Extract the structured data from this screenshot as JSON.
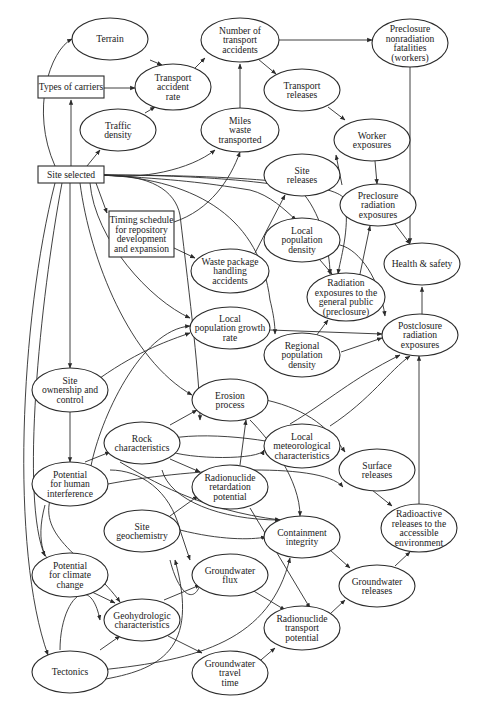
{
  "diagram": {
    "type": "influence-diagram",
    "nodes": [
      {
        "id": "terrain",
        "shape": "ellipse",
        "cx": 110,
        "cy": 39,
        "rx": 38,
        "ry": 21,
        "lines": [
          "Terrain"
        ]
      },
      {
        "id": "num_transport_accidents",
        "shape": "ellipse",
        "cx": 240,
        "cy": 40,
        "rx": 39,
        "ry": 22,
        "lines": [
          "Number of",
          "transport",
          "accidents"
        ]
      },
      {
        "id": "preclosure_nonradiation",
        "shape": "ellipse",
        "cx": 410,
        "cy": 43,
        "rx": 38,
        "ry": 24,
        "lines": [
          "Preclosure",
          "nonradiation",
          "fatalities",
          "(workers)"
        ]
      },
      {
        "id": "types_of_carriers",
        "shape": "rect",
        "x": 38,
        "y": 76,
        "w": 66,
        "h": 22,
        "lines": [
          "Types of carriers"
        ]
      },
      {
        "id": "transport_accident_rate",
        "shape": "ellipse",
        "cx": 173,
        "cy": 87,
        "rx": 38,
        "ry": 23,
        "lines": [
          "Transport",
          "accident",
          "rate"
        ]
      },
      {
        "id": "transport_releases",
        "shape": "ellipse",
        "cx": 302,
        "cy": 90,
        "rx": 38,
        "ry": 21,
        "lines": [
          "Transport",
          "releases"
        ]
      },
      {
        "id": "traffic_density",
        "shape": "ellipse",
        "cx": 118,
        "cy": 130,
        "rx": 38,
        "ry": 21,
        "lines": [
          "Traffic",
          "density"
        ]
      },
      {
        "id": "miles_waste_transported",
        "shape": "ellipse",
        "cx": 240,
        "cy": 130,
        "rx": 39,
        "ry": 22,
        "lines": [
          "Miles",
          "waste",
          "transported"
        ]
      },
      {
        "id": "worker_exposures",
        "shape": "ellipse",
        "cx": 372,
        "cy": 140,
        "rx": 38,
        "ry": 21,
        "lines": [
          "Worker",
          "exposures"
        ]
      },
      {
        "id": "site_selected",
        "shape": "rect",
        "x": 38,
        "y": 166,
        "w": 66,
        "h": 17,
        "lines": [
          "Site selected"
        ]
      },
      {
        "id": "site_releases",
        "shape": "ellipse",
        "cx": 302,
        "cy": 175,
        "rx": 38,
        "ry": 21,
        "lines": [
          "Site",
          "releases"
        ]
      },
      {
        "id": "preclosure_radiation",
        "shape": "ellipse",
        "cx": 378,
        "cy": 205,
        "rx": 38,
        "ry": 21,
        "lines": [
          "Preclosure",
          "radiation",
          "exposures"
        ]
      },
      {
        "id": "timing_schedule",
        "shape": "rect",
        "x": 109,
        "y": 211,
        "w": 65,
        "h": 46,
        "lines": [
          "Timing schedule",
          "for repository",
          "development",
          "and expansion"
        ]
      },
      {
        "id": "local_population_density",
        "shape": "ellipse",
        "cx": 302,
        "cy": 240,
        "rx": 38,
        "ry": 22,
        "lines": [
          "Local",
          "population",
          "density"
        ]
      },
      {
        "id": "waste_package_handling",
        "shape": "ellipse",
        "cx": 230,
        "cy": 271,
        "rx": 39,
        "ry": 22,
        "lines": [
          "Waste package",
          "handling",
          "accidents"
        ]
      },
      {
        "id": "health_safety",
        "shape": "ellipse",
        "cx": 422,
        "cy": 264,
        "rx": 38,
        "ry": 21,
        "lines": [
          "Health & safety"
        ]
      },
      {
        "id": "radiation_general_public",
        "shape": "ellipse",
        "cx": 346,
        "cy": 297,
        "rx": 39,
        "ry": 24,
        "lines": [
          "Radiation",
          "exposures to the",
          "general public",
          "(preclosure)"
        ]
      },
      {
        "id": "local_population_growth",
        "shape": "ellipse",
        "cx": 230,
        "cy": 328,
        "rx": 40,
        "ry": 21,
        "lines": [
          "Local",
          "population growth",
          "rate"
        ]
      },
      {
        "id": "postclosure_radiation",
        "shape": "ellipse",
        "cx": 420,
        "cy": 335,
        "rx": 38,
        "ry": 21,
        "lines": [
          "Postclosure",
          "radiation",
          "exposures"
        ]
      },
      {
        "id": "regional_population_density",
        "shape": "ellipse",
        "cx": 302,
        "cy": 355,
        "rx": 38,
        "ry": 22,
        "lines": [
          "Regional",
          "population",
          "density"
        ]
      },
      {
        "id": "site_ownership",
        "shape": "ellipse",
        "cx": 70,
        "cy": 390,
        "rx": 38,
        "ry": 22,
        "lines": [
          "Site",
          "ownership and",
          "control"
        ]
      },
      {
        "id": "erosion_process",
        "shape": "ellipse",
        "cx": 230,
        "cy": 400,
        "rx": 38,
        "ry": 21,
        "lines": [
          "Erosion",
          "process"
        ]
      },
      {
        "id": "rock_characteristics",
        "shape": "ellipse",
        "cx": 142,
        "cy": 443,
        "rx": 38,
        "ry": 21,
        "lines": [
          "Rock",
          "characteristics"
        ]
      },
      {
        "id": "local_meteorological",
        "shape": "ellipse",
        "cx": 302,
        "cy": 446,
        "rx": 38,
        "ry": 22,
        "lines": [
          "Local",
          "meteorological",
          "characteristics"
        ]
      },
      {
        "id": "surface_releases",
        "shape": "ellipse",
        "cx": 377,
        "cy": 470,
        "rx": 38,
        "ry": 21,
        "lines": [
          "Surface",
          "releases"
        ]
      },
      {
        "id": "potential_human_interference",
        "shape": "ellipse",
        "cx": 70,
        "cy": 484,
        "rx": 38,
        "ry": 22,
        "lines": [
          "Potential",
          "for human",
          "interference"
        ]
      },
      {
        "id": "radionuclide_retardation",
        "shape": "ellipse",
        "cx": 230,
        "cy": 487,
        "rx": 38,
        "ry": 22,
        "lines": [
          "Radionuclide",
          "retardation",
          "potential"
        ]
      },
      {
        "id": "radioactive_releases",
        "shape": "ellipse",
        "cx": 419,
        "cy": 528,
        "rx": 38,
        "ry": 24,
        "lines": [
          "Radioactive",
          "releases to the",
          "accessible",
          "environment"
        ]
      },
      {
        "id": "site_geochemistry",
        "shape": "ellipse",
        "cx": 142,
        "cy": 531,
        "rx": 38,
        "ry": 21,
        "lines": [
          "Site",
          "geochemistry"
        ]
      },
      {
        "id": "containment_integrity",
        "shape": "ellipse",
        "cx": 302,
        "cy": 537,
        "rx": 38,
        "ry": 21,
        "lines": [
          "Containment",
          "integrity"
        ]
      },
      {
        "id": "potential_climate_change",
        "shape": "ellipse",
        "cx": 70,
        "cy": 575,
        "rx": 38,
        "ry": 22,
        "lines": [
          "Potential",
          "for climate",
          "change"
        ]
      },
      {
        "id": "groundwater_flux",
        "shape": "ellipse",
        "cx": 230,
        "cy": 575,
        "rx": 38,
        "ry": 21,
        "lines": [
          "Groundwater",
          "flux"
        ]
      },
      {
        "id": "groundwater_releases",
        "shape": "ellipse",
        "cx": 377,
        "cy": 586,
        "rx": 38,
        "ry": 21,
        "lines": [
          "Groundwater",
          "releases"
        ]
      },
      {
        "id": "geohydrologic",
        "shape": "ellipse",
        "cx": 142,
        "cy": 620,
        "rx": 38,
        "ry": 21,
        "lines": [
          "Geohydrologic",
          "characteristics"
        ]
      },
      {
        "id": "radionuclide_transport",
        "shape": "ellipse",
        "cx": 302,
        "cy": 628,
        "rx": 38,
        "ry": 22,
        "lines": [
          "Radionuclide",
          "transport",
          "potential"
        ]
      },
      {
        "id": "tectonics",
        "shape": "ellipse",
        "cx": 70,
        "cy": 672,
        "rx": 38,
        "ry": 21,
        "lines": [
          "Tectonics"
        ]
      },
      {
        "id": "groundwater_travel_time",
        "shape": "ellipse",
        "cx": 230,
        "cy": 673,
        "rx": 38,
        "ry": 22,
        "lines": [
          "Groundwater",
          "travel",
          "time"
        ]
      }
    ],
    "edges": [
      "M 55 166 C 30 110, 50 50, 72 39",
      "M 71 166 L 71 100",
      "M 87 166 L 100 150",
      "M 104 88 L 135 88",
      "M 150 60 L 162 65",
      "M 145 113 L 155 107",
      "M 195 68 L 205 58",
      "M 240 108 L 240 64",
      "M 279 40 L 372 40",
      "M 258 59 L 276 74",
      "M 328 107 L 345 120",
      "M 342 185 L 336 155",
      "M 375 161 L 377 184",
      "M 410 67 L 410 243",
      "M 395 224 L 410 244",
      "M 422 322 L 422 287",
      "M 104 175 C 140 180, 190 170, 215 150",
      "M 104 175 C 180 180, 200 182, 250 190 C 270 195, 285 210, 296 220",
      "M 104 175 C 220 175, 290 185, 300 190 C 320 210, 330 250, 330 274",
      "M 104 175 C 260 175, 340 185, 345 200 C 350 230, 340 260, 338 274",
      "M 104 175 C 150 175, 175 190, 180 215 C 190 300, 200 380, 200 420",
      "M 96 183 L 107 213",
      "M 90 183 C 95 240, 150 300, 190 318",
      "M 80 183 C 90 260, 130 360, 192 395",
      "M 104 175 C 200 180, 260 220, 270 300 C 275 320, 275 330, 275 334",
      "M 70 183 L 70 368",
      "M 62 183 C 40 300, 20 500, 45 556",
      "M 55 183 C 20 320, 10 550, 48 655",
      "M 174 248 L 195 258",
      "M 174 222 C 210 210, 230 180, 240 152",
      "M 255 253 L 285 195",
      "M 320 260 L 332 274",
      "M 360 274 L 370 226",
      "M 340 245 C 360 250, 380 280, 385 316",
      "M 307 348 L 328 320",
      "M 341 352 L 382 338",
      "M 270 330 L 382 334",
      "M 70 412 L 70 462",
      "M 100 378 C 140 350, 170 340, 190 333",
      "M 91 466 C 100 420, 140 330, 190 326",
      "M 170 425 L 197 410",
      "M 170 459 L 200 472",
      "M 85 462 L 110 452",
      "M 108 484 C 180 470, 320 460, 343 487",
      "M 250 420 C 270 440, 300 480, 300 516",
      "M 266 400 C 310 410, 330 430, 345 452",
      "M 290 424 C 330 400, 350 380, 400 355",
      "M 330 426 C 370 400, 390 370, 410 356",
      "M 110 470 C 140 470, 170 490, 180 530 L 190 560",
      "M 120 462 C 150 480, 200 510, 280 520",
      "M 240 465 L 246 420",
      "M 250 508 L 310 608",
      "M 170 516 L 198 496",
      "M 180 530 C 220 540, 250 540, 266 537",
      "M 372 490 L 392 506",
      "M 419 504 L 419 356",
      "M 330 550 L 350 568",
      "M 395 566 L 410 552",
      "M 330 614 L 345 600",
      "M 164 600 L 200 585",
      "M 168 636 L 202 653",
      "M 252 590 L 285 610",
      "M 255 665 L 275 648",
      "M 92 592 L 115 603",
      "M 100 650 L 120 636",
      "M 100 670 C 200 660, 270 640, 290 558",
      "M 100 680 C 160 670, 200 650, 175 560",
      "M 50 500 C 40 540, 90 560, 120 602",
      "M 45 505 C 30 560, 60 580, 70 553",
      "M 60 650 C 60 600, 90 570, 100 620",
      "M 170 560 C 180 600, 200 610, 204 565",
      "M 164 440 C 200 430, 280 440, 300 450",
      "M 165 450 C 190 460, 260 460, 264 450",
      "M 162 470 C 170 500, 220 520, 280 520"
    ]
  }
}
